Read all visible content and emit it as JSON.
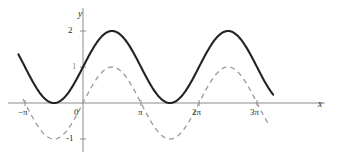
{
  "figure": {
    "width": 339,
    "height": 158,
    "background": "#ffffff",
    "axis_color": "#8c8c8c",
    "solid_curve_color": "#222222",
    "dashed_curve_color": "#9a9a9a",
    "label_color": "#2b2b2b"
  },
  "axes": {
    "x_label": "x",
    "y_label": "y",
    "origin_px": {
      "x": 83,
      "y": 103
    },
    "pixels_per_pi": 58,
    "pixels_per_unit_y": 36
  },
  "ticks": {
    "x": [
      {
        "label": "−π",
        "value": -3.14159,
        "px": 25
      },
      {
        "label": "0",
        "value": 0,
        "px": 83
      },
      {
        "label": "π",
        "value": 3.14159,
        "px": 141
      },
      {
        "label": "2π",
        "value": 6.28319,
        "px": 199
      },
      {
        "label": "3π",
        "value": 9.42478,
        "px": 257
      }
    ],
    "y": [
      {
        "label": "2",
        "value": 2,
        "px": 31
      },
      {
        "label": "1",
        "value": 1,
        "px": 67
      },
      {
        "label": "-1",
        "value": -1,
        "px": 139
      }
    ]
  },
  "chart_data": {
    "type": "line",
    "title": "",
    "xlabel": "x",
    "ylabel": "y",
    "xlim": [
      -4.3,
      11.2
    ],
    "ylim": [
      -1.5,
      2.4
    ],
    "grid": false,
    "legend": null,
    "xticks": [
      "−π",
      "0",
      "π",
      "2π",
      "3π"
    ],
    "xtick_values": [
      -3.14159,
      0,
      3.14159,
      6.28319,
      9.42478
    ],
    "yticks": [
      "2",
      "1",
      "-1"
    ],
    "ytick_values": [
      2,
      1,
      -1
    ],
    "series": [
      {
        "name": "y = 1 + sin(x)",
        "style": "solid",
        "color": "#222222",
        "width": 2.1,
        "amplitude": 1,
        "vertical_shift": 1,
        "phase": 0,
        "period": 6.28319,
        "x_start": -3.5,
        "x_end": 10.3,
        "max": 2,
        "min": 0,
        "maxima_x": [
          1.5708,
          7.85398
        ],
        "minima_x": [
          -1.5708,
          4.71239
        ]
      },
      {
        "name": "y = sin(x)",
        "style": "dashed",
        "color": "#9a9a9a",
        "width": 1.3,
        "amplitude": 1,
        "vertical_shift": 0,
        "phase": 0,
        "period": 6.28319,
        "x_start": -3.25,
        "x_end": 10.0,
        "max": 1,
        "min": -1,
        "maxima_x": [
          1.5708,
          7.85398
        ],
        "minima_x": [
          -1.5708,
          4.71239
        ],
        "zeros_x": [
          -3.14159,
          0,
          3.14159,
          6.28319,
          9.42478
        ]
      }
    ]
  }
}
